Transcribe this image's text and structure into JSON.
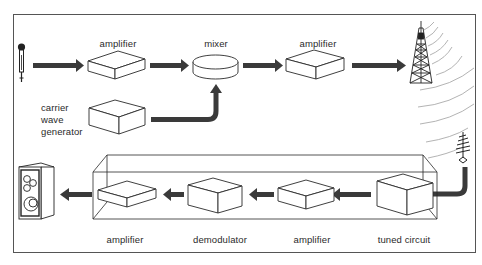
{
  "diagram": {
    "type": "radio transmission and reception block diagram",
    "colors": {
      "line": "#2a2a2a",
      "arrow_fill": "#3a3a3a",
      "wave": "#9a9a9a",
      "background": "#ffffff"
    },
    "transmitter": {
      "source_icon": "microphone-icon",
      "amplifier_1": {
        "label": "amplifier"
      },
      "mixer": {
        "label": "mixer"
      },
      "carrier_wave_generator": {
        "label": "carrier\nwave\ngenerator"
      },
      "amplifier_2": {
        "label": "amplifier"
      },
      "output_icon": "transmitter-tower-icon"
    },
    "receiver": {
      "input_icon": "receiving-aerial-icon",
      "tuned_circuit": {
        "label": "tuned circuit"
      },
      "amplifier_1": {
        "label": "amplifier"
      },
      "demodulator": {
        "label": "demodulator"
      },
      "amplifier_2": {
        "label": "amplifier"
      },
      "output_icon": "loudspeaker-icon"
    }
  }
}
